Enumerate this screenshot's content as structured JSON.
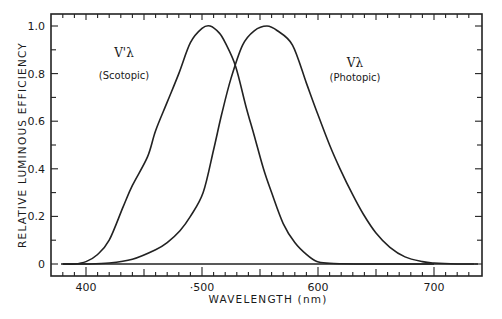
{
  "chart_data": {
    "type": "line",
    "title": "",
    "xlabel": "WAVELENGTH (nm)",
    "ylabel": "RELATIVE LUMINOUS EFFICIENCY",
    "xlim": [
      370,
      740
    ],
    "ylim": [
      0,
      1.05
    ],
    "x_ticks": [
      400,
      500,
      600,
      700
    ],
    "x_tick_labels": [
      "400",
      "·500",
      "600",
      "700"
    ],
    "x_minor_step": 10,
    "y_ticks": [
      0,
      0.2,
      0.4,
      0.6,
      0.8,
      1.0
    ],
    "y_tick_labels": [
      "0",
      "0.2",
      "0.4",
      "0.6",
      "0.8",
      "1.0"
    ],
    "y_minor_step": 0.1,
    "grid": false,
    "legend": "none",
    "series": [
      {
        "name": "Scotopic",
        "symbol": "V'λ",
        "annotation": "(Scotopic)",
        "x": [
          380,
          390,
          400,
          410,
          420,
          432,
          440,
          453,
          460,
          470,
          480,
          490,
          500,
          507,
          515,
          520,
          529,
          538,
          545,
          553,
          560,
          570,
          580,
          590,
          599,
          610,
          620,
          640,
          660,
          680,
          700
        ],
        "y": [
          0.0,
          0.0,
          0.01,
          0.04,
          0.1,
          0.24,
          0.33,
          0.45,
          0.56,
          0.68,
          0.8,
          0.93,
          0.99,
          1.0,
          0.97,
          0.93,
          0.83,
          0.66,
          0.54,
          0.4,
          0.3,
          0.17,
          0.09,
          0.04,
          0.01,
          0.003,
          0.001,
          0.0,
          0.0,
          0.0,
          0.0
        ]
      },
      {
        "name": "Photopic",
        "symbol": "Vλ",
        "annotation": "(Photopic)",
        "x": [
          380,
          400,
          420,
          440,
          460,
          470,
          481,
          490,
          501,
          510,
          517,
          525,
          535,
          545,
          556,
          565,
          578,
          590,
          599,
          610,
          619,
          630,
          639,
          650,
          662,
          675,
          690,
          700,
          720,
          735
        ],
        "y": [
          0.0,
          0.0,
          0.004,
          0.02,
          0.06,
          0.09,
          0.14,
          0.2,
          0.3,
          0.48,
          0.63,
          0.78,
          0.92,
          0.98,
          1.0,
          0.98,
          0.92,
          0.76,
          0.64,
          0.5,
          0.4,
          0.29,
          0.21,
          0.13,
          0.07,
          0.03,
          0.01,
          0.004,
          0.0,
          0.0
        ]
      }
    ]
  }
}
